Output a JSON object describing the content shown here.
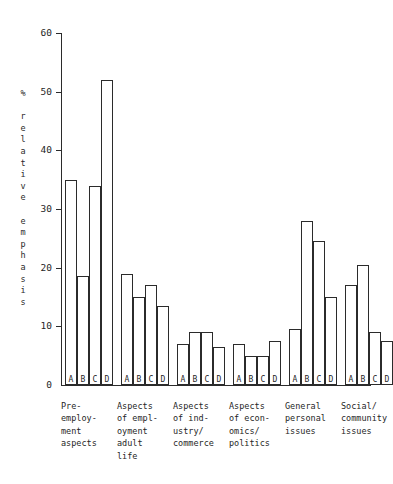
{
  "chart_data": {
    "type": "bar",
    "title": "",
    "subtitle": "",
    "xlabel": "",
    "ylabel": "% relative emphasis",
    "ylim": [
      0,
      60
    ],
    "ytick_labels": [
      "0",
      "10",
      "20",
      "30",
      "40",
      "50",
      "60"
    ],
    "ytick_values": [
      0,
      10,
      20,
      30,
      40,
      50,
      60
    ],
    "grid": false,
    "legend": "none",
    "series_letters": [
      "A",
      "B",
      "C",
      "D"
    ],
    "categories": [
      "Pre-employment aspects",
      "Aspects of employment adult life",
      "Aspects of industry/commerce",
      "Aspects of economics/politics",
      "General personal issues",
      "Social/community issues"
    ],
    "category_caption_lines": [
      [
        "Pre-",
        "employ-",
        "ment",
        "aspects"
      ],
      [
        "Aspects",
        "of empl-",
        "oyment",
        "adult",
        "life"
      ],
      [
        "Aspects",
        "of ind-",
        "ustry/",
        "commerce"
      ],
      [
        "Aspects",
        "of econ-",
        "omics/",
        "politics"
      ],
      [
        "General",
        "personal",
        "issues"
      ],
      [
        "Social/",
        "community",
        "issues"
      ]
    ],
    "groups": [
      {
        "category": "Pre-employment aspects",
        "bars": [
          {
            "label": "A",
            "value": 35
          },
          {
            "label": "B",
            "value": 18.5
          },
          {
            "label": "C",
            "value": 34
          },
          {
            "label": "D",
            "value": 52
          }
        ]
      },
      {
        "category": "Aspects of employment adult life",
        "bars": [
          {
            "label": "A",
            "value": 19
          },
          {
            "label": "B",
            "value": 15
          },
          {
            "label": "C",
            "value": 17
          },
          {
            "label": "D",
            "value": 13.5
          }
        ]
      },
      {
        "category": "Aspects of industry/commerce",
        "bars": [
          {
            "label": "A",
            "value": 7
          },
          {
            "label": "B",
            "value": 9
          },
          {
            "label": "C",
            "value": 9
          },
          {
            "label": "D",
            "value": 6.5
          }
        ]
      },
      {
        "category": "Aspects of economics/politics",
        "bars": [
          {
            "label": "A",
            "value": 7
          },
          {
            "label": "B",
            "value": 5
          },
          {
            "label": "C",
            "value": 5
          },
          {
            "label": "D",
            "value": 7.5
          }
        ]
      },
      {
        "category": "General personal issues",
        "bars": [
          {
            "label": "A",
            "value": 9.5
          },
          {
            "label": "B",
            "value": 28
          },
          {
            "label": "C",
            "value": 24.5
          },
          {
            "label": "D",
            "value": 15
          }
        ]
      },
      {
        "category": "Social/community issues",
        "bars": [
          {
            "label": "A",
            "value": 17
          },
          {
            "label": "B",
            "value": 20.5
          },
          {
            "label": "C",
            "value": 9
          },
          {
            "label": "D",
            "value": 7.5
          }
        ]
      }
    ]
  },
  "style": {
    "line_color": "#2b2b2b",
    "bar_fill": "#ffffff",
    "text_color": "#1f1f1f",
    "background": "#ffffff"
  }
}
